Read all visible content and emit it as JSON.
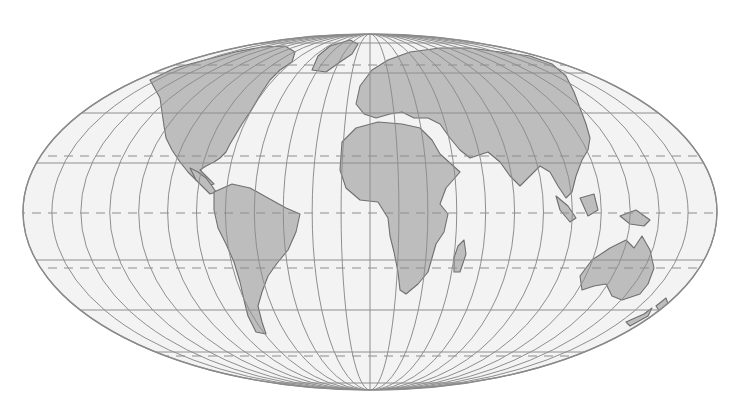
{
  "map": {
    "projection": "Mollweide (equal-area, pseudocylindrical)",
    "ellipse": {
      "cx": 370,
      "cy": 212,
      "rx": 347,
      "ry": 178
    },
    "colors": {
      "ocean": "#f3f3f3",
      "land": "#bdbdbd",
      "coastline": "#6f6f6f",
      "graticule": "#8e8e8e",
      "background": "#ffffff"
    },
    "graticule": {
      "meridian_interval_deg": 15,
      "parallels_solid_y": [
        43,
        73,
        113,
        163,
        260,
        310,
        352,
        383
      ],
      "special_parallels_dashed": [
        {
          "name": "Arctic Circle",
          "y": 65
        },
        {
          "name": "Tropic of Cancer",
          "y": 156
        },
        {
          "name": "Equator",
          "y": 213
        },
        {
          "name": "Tropic of Capricorn",
          "y": 268
        },
        {
          "name": "Antarctic Circle",
          "y": 356
        }
      ]
    },
    "landmasses": [
      "North America",
      "Greenland",
      "South America",
      "Europe",
      "Africa",
      "Madagascar",
      "Asia",
      "Indonesia",
      "Australia",
      "New Zealand"
    ]
  }
}
